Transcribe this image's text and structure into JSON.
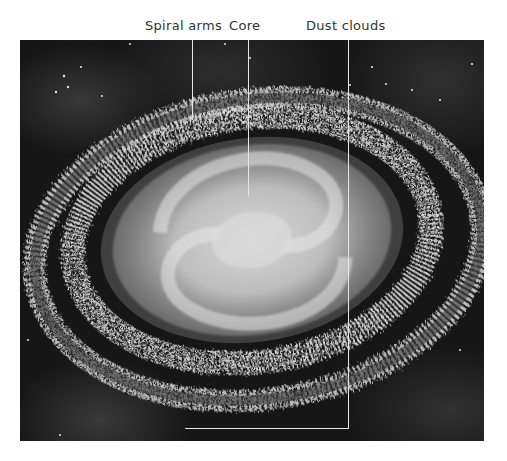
{
  "figure": {
    "labels": [
      {
        "id": "spiral-arms",
        "text": "Spiral arms"
      },
      {
        "id": "core",
        "text": "Core"
      },
      {
        "id": "dust-clouds",
        "text": "Dust clouds"
      }
    ]
  },
  "colors": {
    "background": "#ffffff",
    "space": "#161616",
    "leader_line": "#e6e6e6",
    "label_text": "#333333"
  }
}
